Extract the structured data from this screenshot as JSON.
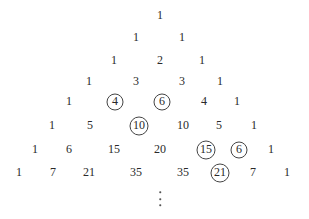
{
  "diagram": {
    "rows": [
      {
        "y": 15,
        "cells": [
          {
            "v": "1",
            "x": 160
          }
        ]
      },
      {
        "y": 37,
        "cells": [
          {
            "v": "1",
            "x": 136
          },
          {
            "v": "1",
            "x": 182
          }
        ]
      },
      {
        "y": 60,
        "cells": [
          {
            "v": "1",
            "x": 114
          },
          {
            "v": "2",
            "x": 160
          },
          {
            "v": "1",
            "x": 202
          }
        ]
      },
      {
        "y": 81,
        "cells": [
          {
            "v": "1",
            "x": 89
          },
          {
            "v": "3",
            "x": 136
          },
          {
            "v": "3",
            "x": 182
          },
          {
            "v": "1",
            "x": 220
          }
        ]
      },
      {
        "y": 101,
        "cells": [
          {
            "v": "1",
            "x": 69
          },
          {
            "v": "4",
            "x": 115,
            "circled": true
          },
          {
            "v": "6",
            "x": 162,
            "circled": true
          },
          {
            "v": "4",
            "x": 204
          },
          {
            "v": "1",
            "x": 237
          }
        ]
      },
      {
        "y": 125,
        "cells": [
          {
            "v": "1",
            "x": 52
          },
          {
            "v": "5",
            "x": 90
          },
          {
            "v": "10",
            "x": 139,
            "circled": true
          },
          {
            "v": "10",
            "x": 183
          },
          {
            "v": "5",
            "x": 219
          },
          {
            "v": "1",
            "x": 254
          }
        ]
      },
      {
        "y": 149,
        "cells": [
          {
            "v": "1",
            "x": 35
          },
          {
            "v": "6",
            "x": 69
          },
          {
            "v": "15",
            "x": 114
          },
          {
            "v": "20",
            "x": 160
          },
          {
            "v": "15",
            "x": 206,
            "circled": true
          },
          {
            "v": "6",
            "x": 239,
            "circled": true
          },
          {
            "v": "1",
            "x": 271
          }
        ]
      },
      {
        "y": 172,
        "cells": [
          {
            "v": "1",
            "x": 19
          },
          {
            "v": "7",
            "x": 53
          },
          {
            "v": "21",
            "x": 89
          },
          {
            "v": "35",
            "x": 136
          },
          {
            "v": "35",
            "x": 183
          },
          {
            "v": "21",
            "x": 220,
            "circled": true
          },
          {
            "v": "7",
            "x": 253
          },
          {
            "v": "1",
            "x": 287
          }
        ]
      }
    ],
    "ellipsis": {
      "x": 160,
      "dots_y": [
        192,
        199,
        205
      ],
      "label": "vertical-ellipsis"
    },
    "colors": {
      "text": "#2a2a2a",
      "circle": "#444444",
      "background": "#ffffff"
    }
  }
}
